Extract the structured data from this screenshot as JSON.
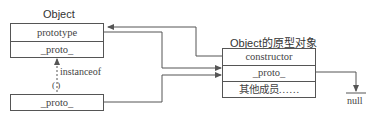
{
  "object_box": {
    "title": "Object",
    "rows": [
      "prototype",
      "_proto_"
    ]
  },
  "instance_box": {
    "rows": [
      "_proto_"
    ]
  },
  "prototype_box": {
    "title": "Object的原型对象",
    "rows": [
      "constructor",
      "_proto_",
      "其他成员……"
    ]
  },
  "labels": {
    "instanceof": "instanceof",
    "paren": "( )",
    "null": "null"
  },
  "colors": {
    "line": "#555555",
    "text": "#444444"
  }
}
